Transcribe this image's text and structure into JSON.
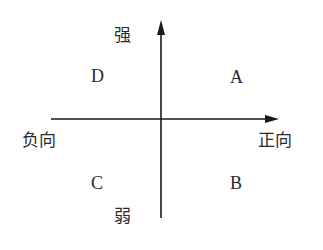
{
  "diagram": {
    "type": "quadrant",
    "axes": {
      "vertical": {
        "top_label": "强",
        "bottom_label": "弱"
      },
      "horizontal": {
        "left_label": "负向",
        "right_label": "正向"
      }
    },
    "quadrants": {
      "top_left": "D",
      "top_right": "A",
      "bottom_left": "C",
      "bottom_right": "B"
    },
    "colors": {
      "line": "#1a1a1a",
      "text": "#2a2a2a",
      "background": "#ffffff"
    }
  }
}
